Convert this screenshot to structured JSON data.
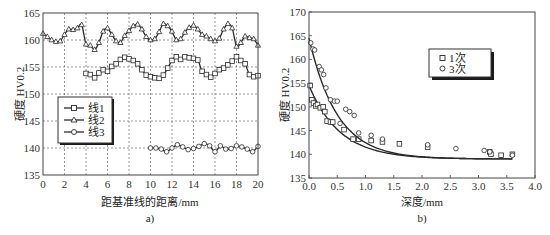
{
  "chart_data": [
    {
      "id": "a",
      "type": "line",
      "caption": "a)",
      "title": "",
      "xlabel": "距基准线的距离/mm",
      "ylabel": "硬度  HV0.2",
      "xlim": [
        0,
        20
      ],
      "ylim": [
        135,
        165
      ],
      "xticks": [
        0,
        2,
        4,
        6,
        8,
        10,
        12,
        14,
        16,
        18,
        20
      ],
      "yticks": [
        135,
        140,
        145,
        150,
        155,
        160,
        165
      ],
      "grid": true,
      "legend_position": "left-middle",
      "series": [
        {
          "name": "线1",
          "marker": "square",
          "x": [
            4.0,
            4.4,
            4.8,
            5.2,
            5.6,
            6.0,
            6.4,
            6.8,
            7.2,
            7.6,
            8.0,
            8.4,
            8.8,
            9.2,
            9.6,
            10.0,
            10.4,
            10.8,
            11.2,
            11.6,
            12.0,
            12.4,
            12.8,
            13.2,
            13.6,
            14.0,
            14.4,
            14.8,
            15.2,
            15.6,
            16.0,
            16.4,
            16.8,
            17.2,
            17.6,
            18.0,
            18.4,
            18.8,
            19.2,
            19.6,
            20.0
          ],
          "y": [
            153.8,
            153.6,
            153.0,
            153.9,
            154.5,
            154.2,
            155.1,
            155.6,
            156.4,
            156.8,
            156.5,
            156.2,
            155.6,
            154.5,
            153.5,
            153.2,
            153.0,
            152.9,
            153.5,
            154.8,
            156.2,
            156.9,
            156.4,
            156.9,
            156.7,
            156.6,
            156.3,
            154.2,
            153.6,
            153.1,
            153.8,
            154.5,
            154.8,
            155.4,
            156.1,
            156.9,
            156.2,
            155.6,
            153.6,
            153.2,
            153.4,
            154.7,
            155.7,
            156.9,
            157.3
          ]
        },
        {
          "name": "线2",
          "marker": "triangle",
          "x": [
            0.0,
            0.4,
            0.8,
            1.2,
            1.6,
            2.0,
            2.4,
            2.8,
            3.2,
            3.6,
            4.0,
            4.4,
            4.8,
            5.2,
            5.6,
            6.0,
            6.4,
            6.8,
            7.2,
            7.6,
            8.0,
            8.4,
            8.8,
            9.2,
            9.6,
            10.0,
            10.4,
            10.8,
            11.2,
            11.6,
            12.0,
            12.4,
            12.8,
            13.2,
            13.6,
            14.0,
            14.4,
            14.8,
            15.2,
            15.6,
            16.0,
            16.4,
            16.8,
            17.2,
            17.6,
            18.0,
            18.4,
            18.8,
            19.2,
            19.6,
            20.0
          ],
          "y": [
            161.2,
            160.6,
            160.0,
            159.7,
            159.8,
            161.0,
            162.0,
            161.9,
            162.2,
            162.8,
            159.2,
            159.0,
            158.2,
            159.5,
            161.6,
            162.2,
            161.0,
            159.8,
            159.5,
            160.8,
            161.7,
            162.6,
            162.9,
            162.0,
            160.6,
            160.0,
            160.2,
            161.5,
            163.0,
            162.6,
            161.6,
            160.0,
            160.2,
            161.4,
            162.3,
            162.7,
            162.0,
            161.0,
            160.7,
            160.2,
            159.8,
            160.3,
            162.0,
            163.0,
            162.2,
            158.8,
            159.5,
            160.7,
            160.4,
            160.2,
            159.0
          ]
        },
        {
          "name": "线3",
          "marker": "circle",
          "x": [
            10.0,
            10.5,
            11.0,
            11.5,
            12.0,
            12.5,
            13.0,
            13.5,
            14.0,
            14.5,
            15.0,
            15.5,
            16.0,
            16.5,
            17.0,
            17.5,
            18.0,
            18.5,
            19.0,
            19.5,
            20.0
          ],
          "y": [
            140.0,
            140.0,
            139.8,
            139.3,
            140.0,
            140.6,
            140.2,
            139.7,
            139.9,
            140.3,
            140.8,
            140.4,
            139.3,
            140.4,
            139.8,
            139.9,
            140.4,
            140.2,
            139.8,
            139.3,
            140.3
          ]
        }
      ]
    },
    {
      "id": "b",
      "type": "scatter",
      "caption": "b)",
      "title": "",
      "xlabel": "深度/mm",
      "ylabel": "硬度  HV0.2",
      "xlim": [
        0.0,
        4.0
      ],
      "ylim": [
        135,
        170
      ],
      "xticks": [
        "0.0",
        "0.5",
        "1.0",
        "1.5",
        "2.0",
        "2.5",
        "3.0",
        "3.5",
        "4.0"
      ],
      "yticks": [
        135,
        140,
        145,
        150,
        155,
        160,
        165,
        170
      ],
      "grid": false,
      "legend_position": "upper-right",
      "series": [
        {
          "name": "1次",
          "marker": "square",
          "x": [
            0.02,
            0.05,
            0.08,
            0.12,
            0.15,
            0.2,
            0.25,
            0.28,
            0.32,
            0.38,
            0.42,
            0.62,
            0.78,
            0.88,
            1.1,
            1.3,
            1.6,
            2.1,
            3.2,
            3.22,
            3.4,
            3.6
          ],
          "y": [
            154.5,
            151.5,
            150.8,
            150.2,
            150.5,
            149.8,
            150.0,
            149.0,
            147.0,
            146.8,
            146.8,
            145.2,
            143.2,
            143.2,
            142.9,
            142.6,
            142.2,
            141.5,
            140.5,
            140.0,
            139.8,
            140.0
          ],
          "fit_y_at_x0": 154.5
        },
        {
          "name": "3次",
          "marker": "circle",
          "x": [
            0.03,
            0.07,
            0.1,
            0.18,
            0.22,
            0.26,
            0.3,
            0.38,
            0.45,
            0.5,
            0.55,
            0.65,
            0.72,
            0.8,
            0.88,
            1.1,
            1.3,
            2.1,
            2.6,
            3.1,
            3.2,
            3.6
          ],
          "y": [
            163.5,
            162.2,
            162.0,
            158.5,
            157.8,
            156.8,
            154.0,
            151.5,
            151.2,
            151.2,
            146.5,
            149.5,
            149.0,
            148.2,
            144.5,
            144.0,
            143.2,
            142.0,
            141.2,
            140.8,
            140.5,
            139.8
          ],
          "fit_y_at_x0": 164.5
        }
      ]
    }
  ],
  "charts": {
    "a": {
      "caption": "a)",
      "xlabel": "距基准线的距离/mm",
      "ylabel": "硬度  HV0.2",
      "legend": [
        "线1",
        "线2",
        "线3"
      ]
    },
    "b": {
      "caption": "b)",
      "xlabel": "深度/mm",
      "ylabel": "硬度  HV0.2",
      "legend": [
        "1次",
        "3次"
      ]
    }
  },
  "colors": {
    "line": "#2a2a2a",
    "grid": "#555555",
    "axis": "#444444",
    "background": "#ffffff"
  }
}
